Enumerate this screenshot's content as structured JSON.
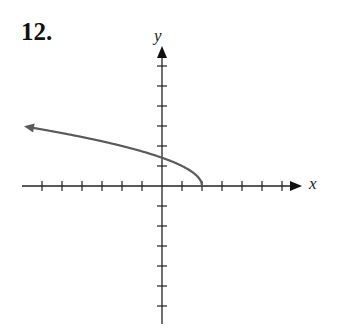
{
  "problem": {
    "number": "12."
  },
  "axes": {
    "x_label": "x",
    "y_label": "y"
  },
  "colors": {
    "axis": "#222222",
    "curve": "#5a5a5a"
  },
  "chart_data": {
    "type": "line",
    "title": "",
    "xlabel": "x",
    "ylabel": "y",
    "function": "y = sqrt(2 - x)",
    "xlim": [
      -7,
      7
    ],
    "ylim": [
      -7,
      7
    ],
    "x_ticks": [
      -6,
      -5,
      -4,
      -3,
      -2,
      -1,
      1,
      2,
      3,
      4,
      5,
      6
    ],
    "y_ticks": [
      -6,
      -5,
      -4,
      -3,
      -2,
      -1,
      1,
      2,
      3,
      4,
      5,
      6
    ],
    "grid": false,
    "series": [
      {
        "name": "curve",
        "x": [
          2,
          1.5,
          1,
          0,
          -1,
          -2,
          -3,
          -4,
          -5,
          -6,
          -6.9
        ],
        "y": [
          0,
          0.71,
          1,
          1.41,
          1.73,
          2,
          2.24,
          2.45,
          2.65,
          2.83,
          2.98
        ],
        "endpoint": [
          2,
          0
        ],
        "arrow_end": "left"
      }
    ]
  }
}
